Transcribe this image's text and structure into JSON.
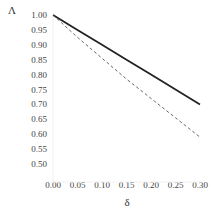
{
  "chart_data": {
    "type": "line",
    "title": "",
    "xlabel": "δ",
    "ylabel": "Λ",
    "xlim": [
      0.0,
      0.3
    ],
    "ylim": [
      0.5,
      1.0
    ],
    "grid": false,
    "legend": null,
    "x_ticks": [
      "0.00",
      "0.05",
      "0.10",
      "0.15",
      "0.20",
      "0.25",
      "0.30"
    ],
    "y_ticks": [
      "1.00",
      "0.95",
      "0.90",
      "0.85",
      "0.80",
      "0.75",
      "0.70",
      "0.65",
      "0.60",
      "0.55",
      "0.50"
    ],
    "x": [
      0.0,
      0.05,
      0.1,
      0.15,
      0.2,
      0.25,
      0.3
    ],
    "series": [
      {
        "name": "solid",
        "style": "solid",
        "color": "#222222",
        "values": [
          1.0,
          0.95,
          0.9,
          0.85,
          0.8,
          0.75,
          0.7
        ]
      },
      {
        "name": "dashed",
        "style": "dashed",
        "color": "#555555",
        "values": [
          1.0,
          0.925,
          0.855,
          0.785,
          0.72,
          0.655,
          0.59
        ]
      }
    ]
  }
}
